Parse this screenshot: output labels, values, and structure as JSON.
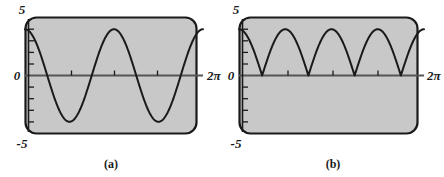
{
  "figure": {
    "panels": [
      {
        "id": "a",
        "caption": "(a)",
        "y_top_label": "5",
        "y_zero_label": "0",
        "y_bottom_label": "-5",
        "x_end_label": "2π",
        "plot_bg": "#c8c8c8",
        "curve_color": "#1a1a1a",
        "border_color": "#1a1a1a"
      },
      {
        "id": "b",
        "caption": "(b)",
        "y_top_label": "5",
        "y_zero_label": "0",
        "y_bottom_label": "-5",
        "x_end_label": "2π",
        "plot_bg": "#c8c8c8",
        "curve_color": "#1a1a1a",
        "border_color": "#1a1a1a"
      }
    ]
  },
  "chart_data": [
    {
      "type": "line",
      "title": "(a)",
      "xlabel": "",
      "ylabel": "",
      "xlim": [
        0,
        6.283185307179586
      ],
      "ylim": [
        -5,
        5
      ],
      "xtick_labels": [
        "0",
        "2π"
      ],
      "ytick_labels": [
        "5",
        "0",
        "-5"
      ],
      "yticks": [
        -5,
        -4,
        -3,
        -2,
        -1,
        0,
        1,
        2,
        3,
        4,
        5
      ],
      "xticks": [
        1.5707963,
        3.1415927,
        4.712389
      ],
      "grid": false,
      "legend": "none",
      "series": [
        {
          "name": "4 cos(2x)",
          "expression": "y = 4*cos(2x)",
          "amplitude": 4,
          "periods_shown": 2,
          "x": [
            0.0,
            0.2,
            0.4,
            0.6,
            0.8,
            1.0,
            1.2,
            1.4,
            1.6,
            1.8,
            2.0,
            2.2,
            2.4,
            2.6,
            2.8,
            3.0,
            3.2,
            3.4,
            3.6,
            3.8,
            4.0,
            4.2,
            4.4,
            4.6,
            4.8,
            5.0,
            5.2,
            5.4,
            5.6,
            5.8,
            6.0,
            6.2832
          ],
          "y": [
            4.0,
            3.68,
            2.79,
            1.48,
            -0.06,
            -1.63,
            -3.0,
            -3.88,
            -4.0,
            -3.4,
            -2.27,
            -0.83,
            0.72,
            2.12,
            3.21,
            3.84,
            3.96,
            3.53,
            2.59,
            1.25,
            -0.29,
            -1.85,
            -3.14,
            -3.94,
            -3.98,
            -3.28,
            -2.07,
            -0.59,
            0.95,
            2.3,
            3.33,
            4.0
          ]
        }
      ]
    },
    {
      "type": "line",
      "title": "(b)",
      "xlabel": "",
      "ylabel": "",
      "xlim": [
        0,
        6.283185307179586
      ],
      "ylim": [
        -5,
        5
      ],
      "xtick_labels": [
        "0",
        "2π"
      ],
      "ytick_labels": [
        "5",
        "0",
        "-5"
      ],
      "yticks": [
        -5,
        -4,
        -3,
        -2,
        -1,
        0,
        1,
        2,
        3,
        4,
        5
      ],
      "xticks": [
        1.5707963,
        3.1415927,
        4.712389
      ],
      "grid": false,
      "legend": "none",
      "series": [
        {
          "name": "4 |cos(2x)|",
          "expression": "y = 4*|cos(2x)|",
          "amplitude": 4,
          "arches_shown": 4,
          "x": [
            0.0,
            0.2,
            0.4,
            0.6,
            0.8,
            1.0,
            1.2,
            1.4,
            1.6,
            1.8,
            2.0,
            2.2,
            2.4,
            2.6,
            2.8,
            3.0,
            3.2,
            3.4,
            3.6,
            3.8,
            4.0,
            4.2,
            4.4,
            4.6,
            4.8,
            5.0,
            5.2,
            5.4,
            5.6,
            5.8,
            6.0,
            6.2832
          ],
          "y": [
            4.0,
            3.68,
            2.79,
            1.48,
            0.06,
            1.63,
            3.0,
            3.88,
            4.0,
            3.4,
            2.27,
            0.83,
            0.72,
            2.12,
            3.21,
            3.84,
            3.96,
            3.53,
            2.59,
            1.25,
            0.29,
            1.85,
            3.14,
            3.94,
            3.98,
            3.28,
            2.07,
            0.59,
            0.95,
            2.3,
            3.33,
            4.0
          ]
        }
      ]
    }
  ]
}
